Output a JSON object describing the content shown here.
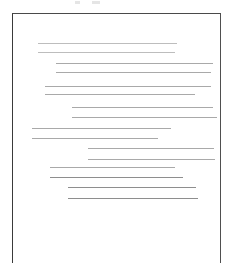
{
  "document": {
    "kind": "scanned-page",
    "page_width": 239,
    "page_height": 275,
    "background_color": "#ffffff",
    "frame": {
      "label": "page-border",
      "left": 12,
      "top": 13,
      "width": 209,
      "height": 250,
      "border_color": "#434343",
      "border_width": 1.4,
      "bottom_edge_visible": false
    },
    "top_specks": [
      {
        "x": 75,
        "y": 1,
        "width": 5,
        "height": 3
      },
      {
        "x": 92,
        "y": 1,
        "width": 8,
        "height": 3
      }
    ],
    "text_lines": [
      {
        "index": 1,
        "paragraph": 1,
        "x": 38,
        "y": 43,
        "width": 139,
        "tone": "faint"
      },
      {
        "index": 2,
        "paragraph": 1,
        "x": 38,
        "y": 52,
        "width": 137,
        "tone": "faint"
      },
      {
        "index": 3,
        "paragraph": 2,
        "x": 56,
        "y": 63,
        "width": 157,
        "tone": "normal"
      },
      {
        "index": 4,
        "paragraph": 2,
        "x": 56,
        "y": 72,
        "width": 155,
        "tone": "normal"
      },
      {
        "index": 5,
        "paragraph": 3,
        "x": 45,
        "y": 86,
        "width": 166,
        "tone": "normal"
      },
      {
        "index": 6,
        "paragraph": 3,
        "x": 45,
        "y": 94,
        "width": 150,
        "tone": "normal"
      },
      {
        "index": 7,
        "paragraph": 4,
        "x": 72,
        "y": 107,
        "width": 141,
        "tone": "normal"
      },
      {
        "index": 8,
        "paragraph": 4,
        "x": 72,
        "y": 117,
        "width": 145,
        "tone": "normal"
      },
      {
        "index": 9,
        "paragraph": 5,
        "x": 32,
        "y": 128,
        "width": 139,
        "tone": "normal"
      },
      {
        "index": 10,
        "paragraph": 5,
        "x": 32,
        "y": 138,
        "width": 126,
        "tone": "normal"
      },
      {
        "index": 11,
        "paragraph": 6,
        "x": 88,
        "y": 148,
        "width": 126,
        "tone": "normal"
      },
      {
        "index": 12,
        "paragraph": 6,
        "x": 88,
        "y": 159,
        "width": 127,
        "tone": "normal"
      },
      {
        "index": 13,
        "paragraph": 7,
        "x": 50,
        "y": 167,
        "width": 125,
        "tone": "normal"
      },
      {
        "index": 14,
        "paragraph": 7,
        "x": 50,
        "y": 177,
        "width": 133,
        "tone": "dark"
      },
      {
        "index": 15,
        "paragraph": 8,
        "x": 68,
        "y": 187,
        "width": 128,
        "tone": "dark"
      },
      {
        "index": 16,
        "paragraph": 8,
        "x": 68,
        "y": 198,
        "width": 130,
        "tone": "dark"
      }
    ]
  }
}
